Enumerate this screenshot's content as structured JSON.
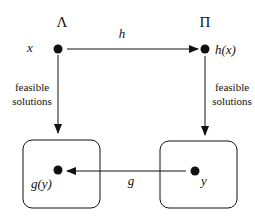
{
  "diagram": {
    "left_domain": {
      "symbol": "Λ",
      "instance": "x",
      "solution": "g(y)"
    },
    "right_domain": {
      "symbol": "Π",
      "instance": "h(x)",
      "solution": "y"
    },
    "top_map": {
      "label": "h"
    },
    "bottom_map": {
      "label": "g"
    },
    "left_edge": {
      "label_line1": "feasible",
      "label_line2": "solutions"
    },
    "right_edge": {
      "label_line1": "feasible",
      "label_line2": "solutions"
    },
    "colors": {
      "ink": "#111111",
      "background": "#ffffff"
    }
  }
}
